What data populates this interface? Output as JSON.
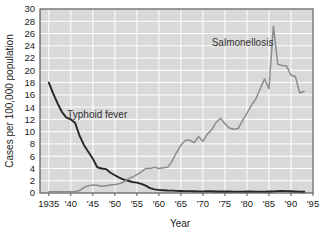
{
  "chart_data": {
    "type": "line",
    "title": "",
    "subtitle": "",
    "xlabel": "Year",
    "ylabel": "Cases per 100,000 population",
    "xlim": [
      1933,
      1995
    ],
    "ylim": [
      0,
      30
    ],
    "grid": true,
    "legend_position": "inline-annotations",
    "x_tick_values": [
      1935,
      1940,
      1945,
      1950,
      1955,
      1960,
      1965,
      1970,
      1975,
      1980,
      1985,
      1990,
      1995
    ],
    "x_tick_labels": [
      "1935",
      "'40",
      "'45",
      "'50",
      "'55",
      "'60",
      "'65",
      "'70",
      "'75",
      "'80",
      "'85",
      "'90",
      "'95"
    ],
    "y_tick_values": [
      0,
      2,
      4,
      6,
      8,
      10,
      12,
      14,
      16,
      18,
      20,
      22,
      24,
      26,
      28,
      30
    ],
    "y_tick_labels": [
      "0",
      "2",
      "4",
      "6",
      "8",
      "10",
      "12",
      "14",
      "16",
      "18",
      "20",
      "22",
      "24",
      "26",
      "28",
      "30"
    ],
    "plot_background_color": "#d9d9d9",
    "grid_color": "#ffffff",
    "frame_color": "#595959",
    "series": [
      {
        "name": "Typhoid fever",
        "color": "#262626",
        "annotation_label": "Typhoid fever",
        "x": [
          1935,
          1936,
          1937,
          1938,
          1939,
          1940,
          1941,
          1942,
          1943,
          1944,
          1945,
          1946,
          1947,
          1948,
          1949,
          1950,
          1951,
          1952,
          1953,
          1954,
          1955,
          1956,
          1957,
          1958,
          1959,
          1960,
          1961,
          1962,
          1963,
          1964,
          1965,
          1966,
          1967,
          1968,
          1969,
          1970,
          1971,
          1972,
          1973,
          1974,
          1975,
          1976,
          1977,
          1978,
          1979,
          1980,
          1981,
          1982,
          1983,
          1984,
          1985,
          1986,
          1987,
          1988,
          1989,
          1990,
          1991,
          1992,
          1993
        ],
        "values": [
          18.0,
          16.2,
          14.6,
          13.2,
          12.3,
          12.0,
          11.4,
          9.3,
          7.8,
          6.7,
          5.6,
          4.2,
          4.0,
          3.9,
          3.3,
          2.9,
          2.5,
          2.2,
          2.0,
          1.8,
          1.7,
          1.5,
          1.2,
          0.8,
          0.6,
          0.5,
          0.45,
          0.4,
          0.38,
          0.35,
          0.33,
          0.3,
          0.3,
          0.28,
          0.27,
          0.26,
          0.3,
          0.28,
          0.25,
          0.24,
          0.25,
          0.24,
          0.23,
          0.22,
          0.22,
          0.25,
          0.24,
          0.23,
          0.22,
          0.22,
          0.24,
          0.26,
          0.3,
          0.32,
          0.3,
          0.28,
          0.25,
          0.22,
          0.2
        ]
      },
      {
        "name": "Salmonellosis",
        "color": "#8c8c8c",
        "annotation_label": "Salmonellosis",
        "x": [
          1935,
          1936,
          1937,
          1938,
          1939,
          1940,
          1941,
          1942,
          1943,
          1944,
          1945,
          1946,
          1947,
          1948,
          1949,
          1950,
          1951,
          1952,
          1953,
          1954,
          1955,
          1956,
          1957,
          1958,
          1959,
          1960,
          1961,
          1962,
          1963,
          1964,
          1965,
          1966,
          1967,
          1968,
          1969,
          1970,
          1971,
          1972,
          1973,
          1974,
          1975,
          1976,
          1977,
          1978,
          1979,
          1980,
          1981,
          1982,
          1983,
          1984,
          1985,
          1986,
          1987,
          1988,
          1989,
          1990,
          1991,
          1992,
          1993
        ],
        "values": [
          0.2,
          0.2,
          0.2,
          0.2,
          0.2,
          0.2,
          0.25,
          0.4,
          0.9,
          1.2,
          1.3,
          1.25,
          1.1,
          1.2,
          1.3,
          1.4,
          1.5,
          1.8,
          2.3,
          2.6,
          3.0,
          3.4,
          4.0,
          4.0,
          4.2,
          4.0,
          4.1,
          4.2,
          5.2,
          6.6,
          7.8,
          8.6,
          8.6,
          8.2,
          9.2,
          8.4,
          9.6,
          10.3,
          11.5,
          12.2,
          11.3,
          10.6,
          10.4,
          10.5,
          11.8,
          13.0,
          14.3,
          15.3,
          17.0,
          18.6,
          17.0,
          27.2,
          21.0,
          20.8,
          20.7,
          19.2,
          19.0,
          16.3,
          16.6
        ]
      }
    ],
    "annotations": [
      {
        "text": "Typhoid fever",
        "x_value": 1946,
        "y_value": 12.2
      },
      {
        "text": "Salmonellosis",
        "x_value": 1979,
        "y_value": 24.0
      }
    ]
  }
}
